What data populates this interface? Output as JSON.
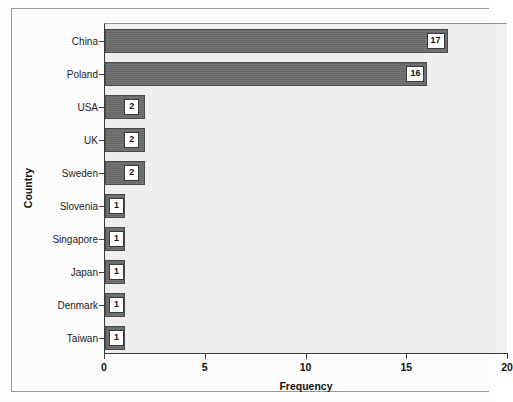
{
  "chart_data": {
    "type": "bar",
    "orientation": "horizontal",
    "title": "",
    "xlabel": "Frequency",
    "ylabel": "Country",
    "categories": [
      "China",
      "Poland",
      "USA",
      "UK",
      "Sweden",
      "Slovenia",
      "Singapore",
      "Japan",
      "Denmark",
      "Taiwan"
    ],
    "values": [
      17,
      16,
      2,
      2,
      2,
      1,
      1,
      1,
      1,
      1
    ],
    "data_labels": [
      "17",
      "16",
      "2",
      "2",
      "2",
      "1",
      "1",
      "1",
      "1",
      "1"
    ],
    "xlim": [
      0,
      20
    ],
    "xticks": [
      0,
      5,
      10,
      15,
      20
    ],
    "xtick_labels": [
      "0",
      "5",
      "10",
      "15",
      "20"
    ],
    "grid": false,
    "legend": null,
    "bar_color": "#6e6e6e",
    "bar_edge_color": "#4a4a4a",
    "plot_background": "#f1f1f1",
    "label_box_background": "#ffffff",
    "label_box_border": "#3a3a3a"
  }
}
